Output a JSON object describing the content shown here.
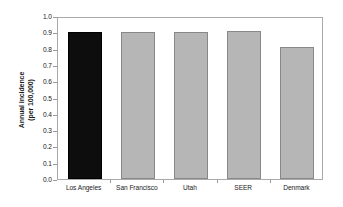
{
  "chart_data": {
    "type": "bar",
    "title": "",
    "subtitle": "",
    "xlabel": "",
    "ylabel": "Annual incidence (per 100,000)",
    "ylabel_lines": [
      "Annual incidence",
      "(per 100,000)"
    ],
    "categories": [
      "Los Angeles",
      "San Francisco",
      "Utah",
      "SEER",
      "Denmark"
    ],
    "values": [
      0.9,
      0.9,
      0.9,
      0.91,
      0.81
    ],
    "ylim": [
      0.0,
      1.0
    ],
    "ytick_labels": [
      "0.0",
      "0.1",
      "0.2",
      "0.3",
      "0.4",
      "0.5",
      "0.6",
      "0.7",
      "0.8",
      "0.9",
      "1.0"
    ],
    "ytick_values": [
      0.0,
      0.1,
      0.2,
      0.3,
      0.4,
      0.5,
      0.6,
      0.7,
      0.8,
      0.9,
      1.0
    ],
    "grid": false,
    "legend": null,
    "bar_colors": [
      "#0d0d0d",
      "#b6b6b6",
      "#b6b6b6",
      "#b6b6b6",
      "#b6b6b6"
    ],
    "bar_edge_colors": [
      "#000000",
      "#888888",
      "#888888",
      "#888888",
      "#888888"
    ],
    "highlight_category": "Los Angeles",
    "axis_color": "#a9a9a9",
    "text_color": "#1a1a1a"
  }
}
